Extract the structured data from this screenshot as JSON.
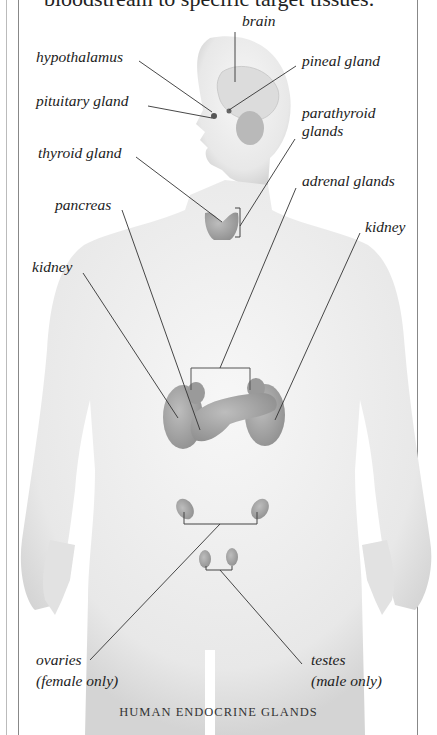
{
  "intro_text": "bloodstream to specific target tissues.",
  "labels": {
    "brain": "brain",
    "hypothalamus": "hypothalamus",
    "pineal_gland": "pineal gland",
    "pituitary_gland": "pituitary gland",
    "parathyroid_glands_1": "parathyroid",
    "parathyroid_glands_2": "glands",
    "thyroid_gland": "thyroid gland",
    "adrenal_glands": "adrenal glands",
    "pancreas": "pancreas",
    "kidney_left": "kidney",
    "kidney_right": "kidney",
    "ovaries_1": "ovaries",
    "ovaries_2": "(female only)",
    "testes_1": "testes",
    "testes_2": "(male only)"
  },
  "caption": "HUMAN ENDOCRINE GLANDS",
  "colors": {
    "body": "#ececec",
    "organ": "#a9a9a9",
    "leader": "#333333"
  }
}
